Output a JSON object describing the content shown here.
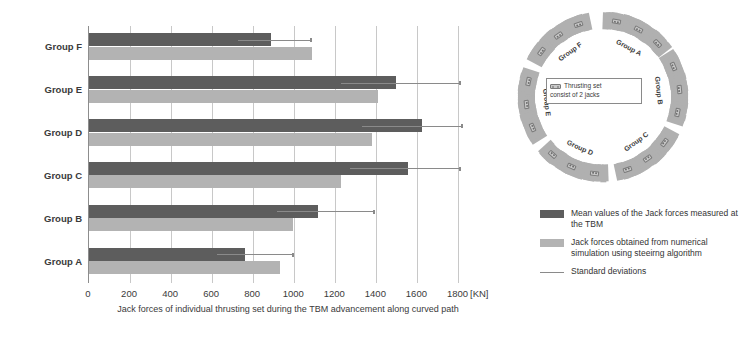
{
  "chart_data": {
    "type": "bar",
    "orientation": "horizontal",
    "title": "",
    "xlabel": "Jack forces of individual thrusting set during the TBM advancement along curved path",
    "ylabel": "",
    "unit": "[KN]",
    "xlim": [
      0,
      1900
    ],
    "xticks": [
      0,
      200,
      400,
      600,
      800,
      1000,
      1200,
      1400,
      1600,
      1800
    ],
    "xticklabels": [
      "0",
      "200",
      "400",
      "600",
      "800",
      "1000",
      "1200",
      "1400",
      "1600",
      "1800"
    ],
    "grid": true,
    "grid_axis": "x",
    "categories": [
      "Group A",
      "Group B",
      "Group C",
      "Group D",
      "Group E",
      "Group F"
    ],
    "category_order_top_to_bottom": [
      "Group F",
      "Group E",
      "Group D",
      "Group C",
      "Group B",
      "Group A"
    ],
    "series": [
      {
        "name": "Mean values of the Jack forces measured at the TBM",
        "color": "#5d5d5d",
        "values": [
          758,
          1116,
          1553,
          1623,
          1498,
          888
        ],
        "errors_upper": [
          1000,
          1395,
          1814,
          1823,
          1814,
          1085
        ]
      },
      {
        "name": "Jack forces obtained from numerical simulation using steeirng algorithm",
        "color": "#b3b3b3",
        "values": [
          930,
          995,
          1228,
          1377,
          1409,
          1088
        ]
      }
    ],
    "legend_position": "right",
    "legend_entries": [
      "Mean values of the Jack forces measured at the TBM",
      "Jack forces obtained from numerical simulation using steeirng algorithm",
      "Standard deviations"
    ]
  },
  "chart": {
    "axis_unit": "[KN]",
    "axis_title": "Jack forces of individual thrusting set during the TBM advancement along curved path",
    "tick_labels": [
      "0",
      "200",
      "400",
      "600",
      "800",
      "1000",
      "1200",
      "1400",
      "1600",
      "1800"
    ],
    "rows": [
      {
        "label": "Group F",
        "mean": 888,
        "sim": 1088,
        "err": 1085
      },
      {
        "label": "Group E",
        "mean": 1498,
        "sim": 1409,
        "err": 1814
      },
      {
        "label": "Group D",
        "mean": 1623,
        "sim": 1377,
        "err": 1823
      },
      {
        "label": "Group C",
        "mean": 1553,
        "sim": 1228,
        "err": 1814
      },
      {
        "label": "Group B",
        "mean": 1116,
        "sim": 995,
        "err": 1395
      },
      {
        "label": "Group A",
        "mean": 758,
        "sim": 930,
        "err": 1000
      }
    ]
  },
  "legend": {
    "items": [
      {
        "type": "dark-swatch",
        "text": "Mean values of the Jack forces measured at the TBM"
      },
      {
        "type": "light-swatch",
        "text": "Jack forces obtained from numerical simulation using steeirng algorithm"
      },
      {
        "type": "line",
        "text": "Standard deviations"
      }
    ]
  },
  "ring": {
    "segments": [
      {
        "label": "Group A"
      },
      {
        "label": "Group B"
      },
      {
        "label": "Group C"
      },
      {
        "label": "Group D"
      },
      {
        "label": "Group E"
      },
      {
        "label": "Group F"
      }
    ],
    "note_line1": "Thrusting set",
    "note_line2": "consist of 2 jacks"
  },
  "colors": {
    "mean_bar": "#5d5d5d",
    "simulation_bar": "#b3b3b3",
    "error_line": "#8a8a8a",
    "grid": "#c8c8c8",
    "ring_segment": "#b0b0b0",
    "background": "#ffffff"
  }
}
